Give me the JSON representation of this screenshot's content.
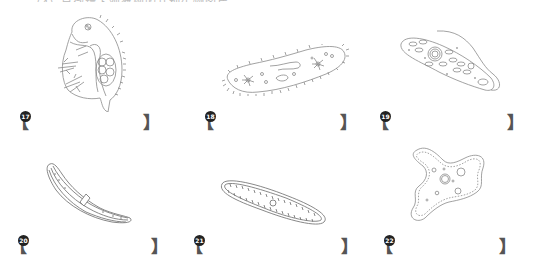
{
  "header": {
    "cutoff_text": "（4）显微镜下观察到的几种生物图片"
  },
  "figures": [
    {
      "number": "17",
      "organism_icon": "water-flea-drawing-icon"
    },
    {
      "number": "18",
      "organism_icon": "paramecium-drawing-icon"
    },
    {
      "number": "19",
      "organism_icon": "euglena-drawing-icon"
    },
    {
      "number": "20",
      "organism_icon": "closterium-drawing-icon"
    },
    {
      "number": "21",
      "organism_icon": "diatom-drawing-icon"
    },
    {
      "number": "22",
      "organism_icon": "amoeba-drawing-icon"
    }
  ],
  "answers": [
    {
      "number": "17",
      "open": "【",
      "close": "】",
      "value": ""
    },
    {
      "number": "18",
      "open": "【",
      "close": "】",
      "value": ""
    },
    {
      "number": "19",
      "open": "【",
      "close": "】",
      "value": ""
    },
    {
      "number": "20",
      "open": "【",
      "close": "】",
      "value": ""
    },
    {
      "number": "21",
      "open": "【",
      "close": "】",
      "value": ""
    },
    {
      "number": "22",
      "open": "【",
      "close": "】",
      "value": ""
    }
  ],
  "colors": {
    "line": "#8a8a8a",
    "bracket": "#555555",
    "badge": "#222222"
  }
}
